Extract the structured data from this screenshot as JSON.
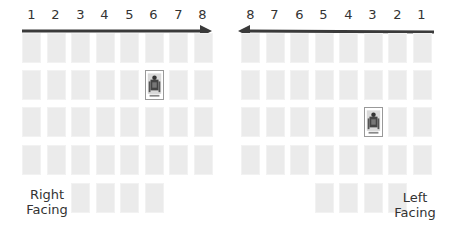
{
  "left_panel": {
    "direction": "right",
    "column_numbers": [
      "1",
      "2",
      "3",
      "4",
      "5",
      "6",
      "7",
      "8"
    ],
    "label_line1": "Right",
    "label_line2": "Facing",
    "rows": 4,
    "columns": 8,
    "bottom_row_columns": [
      3,
      4,
      5,
      6
    ],
    "highlighted_card": {
      "row": 2,
      "column": 6
    }
  },
  "right_panel": {
    "direction": "left",
    "column_numbers": [
      "8",
      "7",
      "6",
      "5",
      "4",
      "3",
      "2",
      "1"
    ],
    "label_line1": "Left",
    "label_line2": "Facing",
    "rows": 4,
    "columns": 8,
    "bottom_row_columns": [
      5,
      4,
      3,
      2
    ],
    "highlighted_card": {
      "row": 3,
      "column": 3
    }
  },
  "colors": {
    "card": "#ebebeb",
    "arrow": "#3a3a3a",
    "text": "#333333"
  }
}
